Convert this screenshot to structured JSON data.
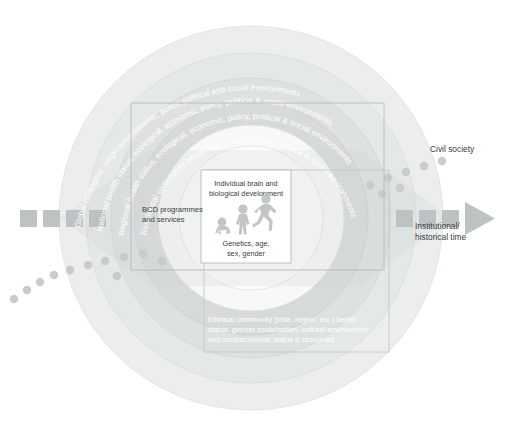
{
  "figure": {
    "background": "#ffffff",
    "center": {
      "box_label_top": "Individual brain and biological development",
      "box_label_bottom": "Genetics, age, sex, gender",
      "figures_icon": "human-lifespan-silhouettes"
    },
    "rings": [
      {
        "id": "ring-global",
        "label": "Global ecological, corporate/economic, policy, political and social environments",
        "fill": "#eceded",
        "level": 1
      },
      {
        "id": "ring-national",
        "label": "National health status, ecological, economic, policy, political & social environments",
        "fill": "#e6e8e8",
        "level": 2
      },
      {
        "id": "ring-regional",
        "label": "Regional health status, ecological, economic, policy, political & social environments",
        "fill": "#dfe1e1",
        "level": 3
      },
      {
        "id": "ring-residential",
        "label": "Residential community health status and culture, service & social environments",
        "fill": "#d8dbdb",
        "level": 4
      }
    ],
    "boxes": [
      {
        "id": "box-bcd",
        "label": "BCD programmes and services",
        "stroke": "#b9bcbc"
      },
      {
        "id": "box-ethnic",
        "label": "Ethnical community (tribe, region, etc.) health status, gender socialisation, cultural environment and socioeconomic status & resources",
        "stroke": "#c6c9c9",
        "text_color": "#ffffff"
      }
    ],
    "annotations": [
      {
        "id": "civil-society",
        "label": "Civil society"
      },
      {
        "id": "institutional-time",
        "label": "Institutional/ historical time"
      }
    ],
    "arrow": {
      "name": "institutional-historical-time-arrow",
      "color": "#bcbfbf",
      "direction": "left-to-right",
      "dash_count": 8
    },
    "dot_trail": {
      "name": "civil-society-dot-trail",
      "color": "#c9cccc",
      "dot_count": 18
    },
    "colors": {
      "text_dark": "#3a3d3d",
      "text_light": "#ffffff",
      "ring_outline": "#e3e5e5",
      "wedge": "#ced1d1"
    }
  }
}
